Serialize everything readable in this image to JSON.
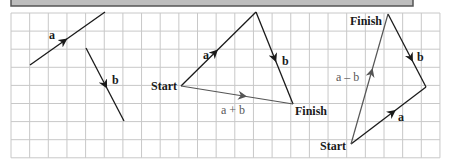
{
  "colors": {
    "background": "#ffffff",
    "grid": "#c8c8c8",
    "header_fill": "#bdbdbd",
    "header_border": "#555555",
    "vector": "#1a1a1a",
    "resultant": "#555555"
  },
  "grid": {
    "x0": 11,
    "y0": 13,
    "step_x": 18.65,
    "step_y": 18.1,
    "cols": 23,
    "rows": 8
  },
  "panel1": {
    "a": {
      "label": "a",
      "from": [
        30,
        65
      ],
      "to": [
        105,
        12
      ]
    },
    "b": {
      "label": "b",
      "from": [
        86,
        48
      ],
      "to": [
        124,
        121
      ]
    }
  },
  "panel2": {
    "start_label": "Start",
    "finish_label": "Finish",
    "a": {
      "label": "a",
      "from": [
        181,
        86
      ],
      "to": [
        256,
        12
      ]
    },
    "b": {
      "label": "b",
      "from": [
        256,
        12
      ],
      "to": [
        293,
        104
      ]
    },
    "sum": {
      "label": "a + b",
      "from": [
        181,
        86
      ],
      "to": [
        293,
        104
      ]
    }
  },
  "panel3": {
    "start_label": "Start",
    "finish_label": "Finish",
    "a": {
      "label": "a",
      "from": [
        351,
        144
      ],
      "to": [
        426,
        87
      ]
    },
    "b": {
      "label": "b",
      "from": [
        388,
        14
      ],
      "to": [
        426,
        87
      ]
    },
    "diff": {
      "label": "a – b",
      "from": [
        351,
        144
      ],
      "to": [
        388,
        14
      ]
    }
  }
}
